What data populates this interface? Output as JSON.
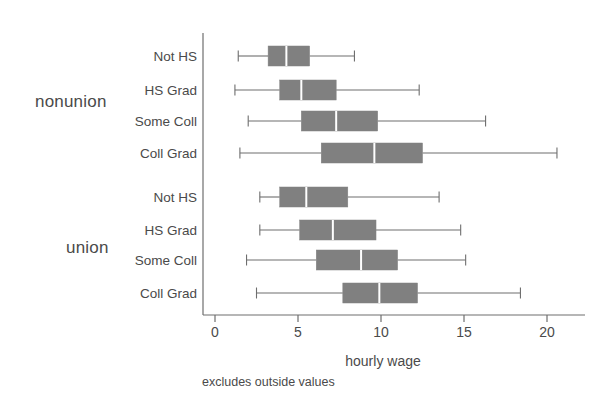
{
  "chart_data": {
    "type": "box",
    "title": "",
    "xlabel": "hourly wage",
    "ylabel": "",
    "note": "excludes outside values",
    "xlim": [
      0,
      21.8
    ],
    "xticks": [
      0,
      5,
      10,
      15,
      20
    ],
    "xticklabels": [
      "0",
      "5",
      "10",
      "15",
      "20"
    ],
    "grid": false,
    "legend": null,
    "orientation": "horizontal",
    "box_color": "#808080",
    "line_color": "#6e6e6e",
    "groups": [
      {
        "name": "nonunion",
        "boxes": [
          {
            "label": "Not HS",
            "whisker_low": 1.4,
            "q1": 3.2,
            "median": 4.3,
            "q3": 5.7,
            "whisker_high": 8.4
          },
          {
            "label": "HS Grad",
            "whisker_low": 1.2,
            "q1": 3.9,
            "median": 5.2,
            "q3": 7.3,
            "whisker_high": 12.3
          },
          {
            "label": "Some Coll",
            "whisker_low": 2.0,
            "q1": 5.2,
            "median": 7.3,
            "q3": 9.8,
            "whisker_high": 16.3
          },
          {
            "label": "Coll Grad",
            "whisker_low": 1.5,
            "q1": 6.4,
            "median": 9.6,
            "q3": 12.5,
            "whisker_high": 20.6
          }
        ]
      },
      {
        "name": "union",
        "boxes": [
          {
            "label": "Not HS",
            "whisker_low": 2.7,
            "q1": 3.9,
            "median": 5.5,
            "q3": 8.0,
            "whisker_high": 13.5
          },
          {
            "label": "HS Grad",
            "whisker_low": 2.7,
            "q1": 5.1,
            "median": 7.1,
            "q3": 9.7,
            "whisker_high": 14.8
          },
          {
            "label": "Some Coll",
            "whisker_low": 1.9,
            "q1": 6.1,
            "median": 8.8,
            "q3": 11.0,
            "whisker_high": 15.1
          },
          {
            "label": "Coll Grad",
            "whisker_low": 2.5,
            "q1": 7.7,
            "median": 9.9,
            "q3": 12.2,
            "whisker_high": 18.4
          }
        ]
      }
    ]
  }
}
